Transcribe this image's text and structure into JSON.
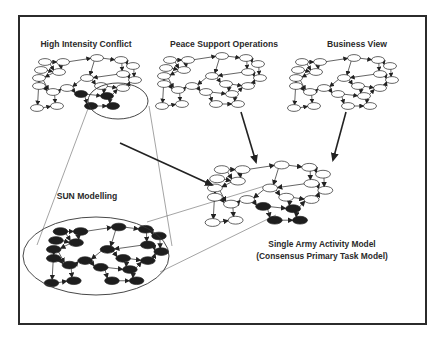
{
  "diagram": {
    "frame": {
      "x": 19,
      "y": 16,
      "w": 407,
      "h": 308,
      "stroke": "#2b2b2b"
    },
    "colors": {
      "node_fill": "#ffffff",
      "node_dark": "#1e1e1e",
      "edge": "#222222",
      "thin_line": "#555555"
    },
    "labels": {
      "high_intensity_conflict": "High Intensity Conflict",
      "peace_support_operations": "Peace Support Operations",
      "business_view": "Business View",
      "sun_modelling": "SUN Modelling",
      "single_army_line1": "Single Army Activity Model",
      "single_army_line2": "(Consensus Primary Task Model)"
    },
    "graphs": [
      {
        "id": "high-intensity-conflict-graph",
        "x": 33,
        "y": 58,
        "scale": 1.0,
        "dark_nodes": [
          13,
          14,
          15,
          16
        ]
      },
      {
        "id": "peace-support-operations-graph",
        "x": 158,
        "y": 56,
        "scale": 1.0,
        "dark_nodes": []
      },
      {
        "id": "business-view-graph",
        "x": 290,
        "y": 58,
        "scale": 1.0,
        "dark_nodes": []
      },
      {
        "id": "single-army-activity-model-graph",
        "x": 208,
        "y": 165,
        "scale": 1.15,
        "dark_nodes": [
          13,
          14,
          15,
          16
        ]
      },
      {
        "id": "sun-modelling-zoomed-graph",
        "x": 47,
        "y": 227,
        "scale": 1.12,
        "dark_nodes": "all"
      }
    ],
    "callout_small_ellipse": {
      "cx": 118,
      "cy": 101,
      "rx": 30,
      "ry": 18
    },
    "callout_large_ellipse": {
      "cx": 96,
      "cy": 256,
      "rx": 73,
      "ry": 39
    },
    "arrows": [
      {
        "id": "hic-to-sun-arrow",
        "x1": 120,
        "y1": 143,
        "x2": 212,
        "y2": 185
      },
      {
        "id": "pso-to-model-arrow",
        "x1": 241,
        "y1": 112,
        "x2": 256,
        "y2": 162
      },
      {
        "id": "business-to-model-arrow",
        "x1": 346,
        "y1": 112,
        "x2": 333,
        "y2": 160
      }
    ]
  }
}
